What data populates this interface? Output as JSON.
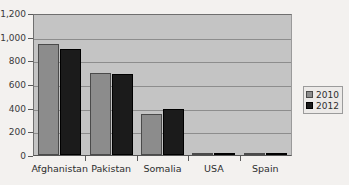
{
  "chart_data": {
    "type": "bar",
    "title": "",
    "xlabel": "",
    "ylabel": "",
    "ylim": [
      0,
      1200
    ],
    "yticks": [
      0,
      200,
      400,
      600,
      800,
      1000,
      1200
    ],
    "ytick_labels": [
      "0",
      "200",
      "400",
      "600",
      "800",
      "1,000",
      "1,200"
    ],
    "grid": true,
    "legend_position": "right",
    "categories": [
      "Afghanistan",
      "Pakistan",
      "Somalia",
      "USA",
      "Spain"
    ],
    "series": [
      {
        "name": "2010",
        "color": "#8c8c8c",
        "values": [
          955,
          700,
          348,
          15,
          8
        ]
      },
      {
        "name": "2012",
        "color": "#1b1b1b",
        "values": [
          910,
          698,
          395,
          10,
          12
        ]
      }
    ]
  },
  "legend": {
    "entries": [
      {
        "label": "2010"
      },
      {
        "label": "2012"
      }
    ]
  },
  "colors": {
    "page_background": "#f3f1ef",
    "plot_background": "#c4c4c4",
    "gridline": "#8d8d8d",
    "axis": "#5a5a5a",
    "series_2010": "#8c8c8c",
    "series_2012": "#1b1b1b"
  }
}
